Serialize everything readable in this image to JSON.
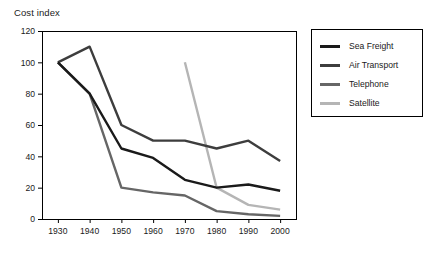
{
  "chart_data": {
    "type": "line",
    "title": "Cost index",
    "xlabel": "",
    "ylabel": "",
    "x": [
      1930,
      1940,
      1950,
      1960,
      1970,
      1980,
      1990,
      2000
    ],
    "xticklabels": [
      "1930",
      "1940",
      "1950",
      "1960",
      "1970",
      "1980",
      "1990",
      "2000"
    ],
    "yticklabels": [
      "0",
      "20",
      "40",
      "60",
      "80",
      "100",
      "120"
    ],
    "yticks": [
      0,
      20,
      40,
      60,
      80,
      100,
      120
    ],
    "xlim": [
      1925,
      2005
    ],
    "ylim": [
      0,
      120
    ],
    "grid": false,
    "legend_position": "right-outside",
    "series": [
      {
        "name": "Sea Freight",
        "color": "#1a1a1a",
        "x": [
          1930,
          1940,
          1950,
          1960,
          1970,
          1980,
          1990,
          2000
        ],
        "values": [
          100,
          80,
          45,
          39,
          25,
          20,
          22,
          18
        ]
      },
      {
        "name": "Air Transport",
        "color": "#3d3d3d",
        "x": [
          1930,
          1940,
          1950,
          1960,
          1970,
          1980,
          1990,
          2000
        ],
        "values": [
          100,
          110,
          60,
          50,
          50,
          45,
          50,
          37
        ]
      },
      {
        "name": "Telephone",
        "color": "#666666",
        "x": [
          1930,
          1940,
          1950,
          1960,
          1970,
          1980,
          1990,
          2000
        ],
        "values": [
          100,
          80,
          20,
          17,
          15,
          5,
          3,
          2
        ]
      },
      {
        "name": "Satellite",
        "color": "#b5b5b5",
        "x": [
          1970,
          1980,
          1990,
          2000
        ],
        "values": [
          100,
          20,
          9,
          6
        ]
      }
    ]
  },
  "legend": {
    "items": [
      {
        "label": "Sea Freight",
        "color": "#1a1a1a"
      },
      {
        "label": "Air Transport",
        "color": "#3d3d3d"
      },
      {
        "label": "Telephone",
        "color": "#666666"
      },
      {
        "label": "Satellite",
        "color": "#b5b5b5"
      }
    ]
  }
}
